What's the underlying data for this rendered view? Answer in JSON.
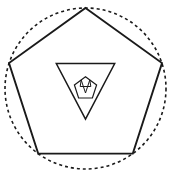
{
  "figure": {
    "title": "Recursive pentagram inscribed in dashed circle",
    "background_color": "#ffffff",
    "stroke_color": "#1a1a1a",
    "width": 171,
    "height": 177
  },
  "chart_data": {
    "type": "diagram",
    "subtype": "recursive-pentagram",
    "title": "Recursive pentagram inscribed in dashed circle",
    "grid": false,
    "legend": null,
    "xlabel": "",
    "ylabel": "",
    "circle": {
      "label": "construction-circle",
      "center_x": 85.5,
      "center_y": 88.5,
      "radius": 80.5,
      "stroke_style": "dashed",
      "dash_pattern": "3 3",
      "stroke_width": 1.6,
      "color": "#1a1a1a"
    },
    "levels": [
      {
        "index": 0,
        "name": "outer-pentagram",
        "radius": 80.5,
        "rotation_deg": 0,
        "orientation": "point-up",
        "stroke_width": 1.9,
        "vertices": [
          {
            "label": "top",
            "x": 85.5,
            "y": 8.0
          },
          {
            "label": "right",
            "x": 162.0,
            "y": 63.0
          },
          {
            "label": "bottom-right",
            "x": 132.8,
            "y": 153.6
          },
          {
            "label": "bottom-left",
            "x": 38.2,
            "y": 153.6
          },
          {
            "label": "left",
            "x": 9.0,
            "y": 63.0
          }
        ]
      },
      {
        "index": 1,
        "name": "second-pentagram",
        "radius": 30.7,
        "rotation_deg": 180,
        "orientation": "point-down",
        "stroke_width": 1.5,
        "vertices": [
          {
            "label": "bottom",
            "x": 85.5,
            "y": 119.2
          },
          {
            "label": "left",
            "x": 56.3,
            "y": 63.5
          },
          {
            "label": "upper-left",
            "x": 65.5,
            "y": 63.5
          },
          {
            "label": "upper-right",
            "x": 105.5,
            "y": 63.5
          },
          {
            "label": "right",
            "x": 114.7,
            "y": 63.5
          }
        ]
      },
      {
        "index": 2,
        "name": "third-pentagram",
        "radius": 11.7,
        "rotation_deg": 0,
        "orientation": "point-up",
        "stroke_width": 1.2,
        "vertices": [
          {
            "label": "top",
            "x": 85.5,
            "y": 76.8
          },
          {
            "label": "right",
            "x": 96.6,
            "y": 84.9
          },
          {
            "label": "bottom-right",
            "x": 92.4,
            "y": 98.0
          },
          {
            "label": "bottom-left",
            "x": 78.6,
            "y": 98.0
          },
          {
            "label": "left",
            "x": 74.4,
            "y": 84.9
          }
        ]
      },
      {
        "index": 3,
        "name": "fourth-pentagram",
        "radius": 4.5,
        "rotation_deg": 180,
        "orientation": "point-down",
        "stroke_width": 1.0,
        "vertices": [
          {
            "label": "bottom",
            "x": 85.5,
            "y": 93.0
          },
          {
            "label": "upper-right",
            "x": 89.8,
            "y": 79.9
          },
          {
            "label": "right",
            "x": 90.8,
            "y": 86.5
          },
          {
            "label": "left",
            "x": 80.2,
            "y": 86.5
          },
          {
            "label": "upper-left",
            "x": 81.2,
            "y": 79.9
          }
        ]
      }
    ],
    "geometry_notes": {
      "star_polygon_schlafli": "{5/2}",
      "nesting_ratio": 0.381966,
      "nesting_rotation_deg": 180,
      "level_count": 4,
      "circumscribed_shape": "circle"
    }
  }
}
